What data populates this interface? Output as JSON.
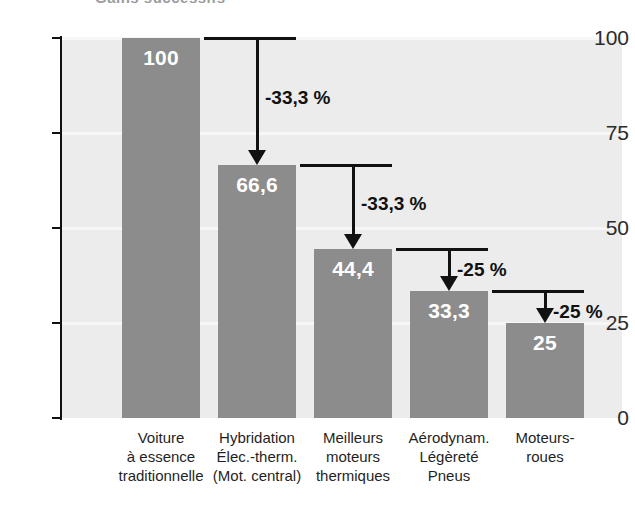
{
  "figure": {
    "partial_title": "Gains successifs",
    "width": 635,
    "height": 505
  },
  "axis": {
    "y_ticks": [
      "100",
      "75",
      "50",
      "25",
      "0"
    ],
    "y_tick_values": [
      100,
      75,
      50,
      25,
      0
    ]
  },
  "colors": {
    "bar": "#8c8c8c",
    "plot_background": "#ececec",
    "gridline": "#f7f7f7",
    "axis": "#111111",
    "bar_label": "#ffffff",
    "annotation": "#111111"
  },
  "bars": [
    {
      "value_label": "100",
      "value": 100,
      "category_lines": [
        "Voiture",
        "à essence",
        "traditionnelle"
      ]
    },
    {
      "value_label": "66,6",
      "value": 66.6,
      "category_lines": [
        "Hybridation",
        "Élec.-therm.",
        "(Mot. central)"
      ]
    },
    {
      "value_label": "44,4",
      "value": 44.4,
      "category_lines": [
        "Meilleurs",
        "moteurs",
        "thermiques"
      ]
    },
    {
      "value_label": "33,3",
      "value": 33.3,
      "category_lines": [
        "Aérodynam.",
        "Légèreté",
        "Pneus"
      ]
    },
    {
      "value_label": "25",
      "value": 25,
      "category_lines": [
        "Moteurs-",
        "roues"
      ]
    }
  ],
  "deltas": [
    {
      "label": "-33,3 %",
      "from": 100,
      "to": 66.6
    },
    {
      "label": "-33,3 %",
      "from": 66.6,
      "to": 44.4
    },
    {
      "label": "-25 %",
      "from": 44.4,
      "to": 33.3
    },
    {
      "label": "-25 %",
      "from": 33.3,
      "to": 25
    }
  ],
  "chart_data": {
    "type": "bar",
    "title": "Gains successifs",
    "xlabel": "",
    "ylabel": "",
    "ylim": [
      0,
      100
    ],
    "yticks": [
      0,
      25,
      50,
      75,
      100
    ],
    "grid": true,
    "legend": false,
    "categories": [
      "Voiture à essence traditionnelle",
      "Hybridation Élec.-therm. (Mot. central)",
      "Meilleurs moteurs thermiques",
      "Aérodynam. Légèreté Pneus",
      "Moteurs-roues"
    ],
    "values": [
      100,
      66.6,
      44.4,
      33.3,
      25
    ],
    "data_labels": [
      "100",
      "66,6",
      "44,4",
      "33,3",
      "25"
    ],
    "annotations": [
      {
        "text": "-33,3 %",
        "between": [
          "Voiture à essence traditionnelle",
          "Hybridation Élec.-therm. (Mot. central)"
        ],
        "from": 100,
        "to": 66.6
      },
      {
        "text": "-33,3 %",
        "between": [
          "Hybridation Élec.-therm. (Mot. central)",
          "Meilleurs moteurs thermiques"
        ],
        "from": 66.6,
        "to": 44.4
      },
      {
        "text": "-25 %",
        "between": [
          "Meilleurs moteurs thermiques",
          "Aérodynam. Légèreté Pneus"
        ],
        "from": 44.4,
        "to": 33.3
      },
      {
        "text": "-25 %",
        "between": [
          "Aérodynam. Légèreté Pneus",
          "Moteurs-roues"
        ],
        "from": 33.3,
        "to": 25
      }
    ]
  }
}
